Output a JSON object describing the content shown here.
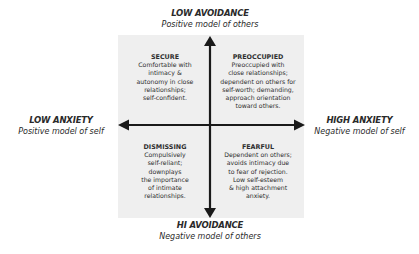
{
  "diagram": {
    "type": "quadrant",
    "colors": {
      "background": "#ffffff",
      "box": "#efefef",
      "axis": "#1a1a1a",
      "text": "#2a2a2a"
    },
    "axes": {
      "top": {
        "title": "LOW AVOIDANCE",
        "subtitle": "Positive model of others"
      },
      "bottom": {
        "title": "HI AVOIDANCE",
        "subtitle": "Negative model of others"
      },
      "left": {
        "title": "LOW ANXIETY",
        "subtitle": "Positive model of self"
      },
      "right": {
        "title": "HIGH ANXIETY",
        "subtitle": "Negative model of self"
      }
    },
    "quadrants": {
      "secure": {
        "title": "SECURE",
        "lines": [
          "Comfortable with",
          "intimacy &",
          "autonomy in close",
          "relationships;",
          "self-confident."
        ]
      },
      "preoccupied": {
        "title": "PREOCCUPIED",
        "lines": [
          "Preoccupied with",
          "close relationships;",
          "dependent on others  for",
          "self-worth; demanding,",
          "approach orientation",
          "toward others."
        ]
      },
      "dismissing": {
        "title": "DISMISSING",
        "lines": [
          "Compulsively",
          "self-reliant;",
          "downplays",
          "the importance",
          "of intimate",
          "relationships."
        ]
      },
      "fearful": {
        "title": "FEARFUL",
        "lines": [
          "Dependent on others;",
          "avoids intimacy due",
          "to fear of rejection.",
          "Low self-esteem",
          "& high attachment",
          "anxiety."
        ]
      }
    }
  }
}
